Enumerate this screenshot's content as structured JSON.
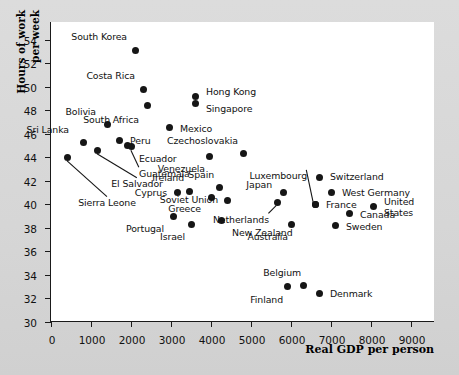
{
  "chart_data": {
    "type": "scatter",
    "title": "",
    "xlabel": "Real GDP per person",
    "ylabel_line1": "Hours of work",
    "ylabel_line2": "per week",
    "xlim": [
      0,
      9600
    ],
    "ylim": [
      30,
      55.5
    ],
    "xticks": [
      0,
      1000,
      2000,
      3000,
      4000,
      5000,
      6000,
      7000,
      8000,
      9000
    ],
    "xticklabels": [
      "0",
      "1000",
      "2000",
      "3000",
      "4000",
      "5000",
      "6000",
      "7000",
      "8000",
      "9000"
    ],
    "yticks": [
      30,
      32,
      34,
      36,
      38,
      40,
      42,
      44,
      46,
      48,
      50,
      52,
      54
    ],
    "yticklabels": [
      "30",
      "32",
      "34",
      "36",
      "38",
      "40",
      "42",
      "44",
      "46",
      "48",
      "50",
      "52",
      "54"
    ],
    "grid": false,
    "legend": null,
    "marker_color": "#161616",
    "points": [
      {
        "name": "Sierra Leone",
        "x": 400,
        "y": 44.0,
        "label_dx": 40,
        "label_dy": 46,
        "anchor": "c",
        "leader": true
      },
      {
        "name": "Sri Lanka",
        "x": 800,
        "y": 45.3,
        "label_dx": -14,
        "label_dy": -12,
        "anchor": "r",
        "leader": false
      },
      {
        "name": "El Salvador",
        "x": 1150,
        "y": 44.6,
        "label_dx": 40,
        "label_dy": 34,
        "anchor": "c",
        "leader": true
      },
      {
        "name": "Bolivia",
        "x": 1400,
        "y": 46.8,
        "label_dx": -11,
        "label_dy": -12,
        "anchor": "r",
        "leader": false
      },
      {
        "name": "Peru",
        "x": 1700,
        "y": 45.4,
        "label_dx": 11,
        "label_dy": 0,
        "anchor": "l",
        "leader": false
      },
      {
        "name": "Ecuador",
        "x": 1900,
        "y": 45.0,
        "label_dx": 12,
        "label_dy": 13,
        "anchor": "l",
        "leader": false
      },
      {
        "name": "Guatemala",
        "x": 2000,
        "y": 44.9,
        "label_dx": 8,
        "label_dy": 27,
        "anchor": "l",
        "leader": true
      },
      {
        "name": "South Korea",
        "x": 2100,
        "y": 53.1,
        "label_dx": -8,
        "label_dy": -13,
        "anchor": "r",
        "leader": false
      },
      {
        "name": "Costa Rica",
        "x": 2300,
        "y": 49.8,
        "label_dx": -8,
        "label_dy": -13,
        "anchor": "r",
        "leader": false
      },
      {
        "name": "South Africa",
        "x": 2400,
        "y": 48.4,
        "label_dx": -8,
        "label_dy": 14,
        "anchor": "r",
        "leader": false
      },
      {
        "name": "Mexico",
        "x": 2950,
        "y": 46.5,
        "label_dx": 11,
        "label_dy": 1,
        "anchor": "l",
        "leader": false
      },
      {
        "name": "Portugal",
        "x": 3050,
        "y": 39.0,
        "label_dx": -9,
        "label_dy": 13,
        "anchor": "r",
        "leader": false
      },
      {
        "name": "Cyprus",
        "x": 3150,
        "y": 41.0,
        "label_dx": -10,
        "label_dy": 0,
        "anchor": "r",
        "leader": false
      },
      {
        "name": "Ireland",
        "x": 3450,
        "y": 41.1,
        "label_dx": -5,
        "label_dy": -13,
        "anchor": "r",
        "leader": false
      },
      {
        "name": "Israel",
        "x": 3500,
        "y": 38.3,
        "label_dx": -6,
        "label_dy": 13,
        "anchor": "r",
        "leader": false
      },
      {
        "name": "Venezuela",
        "x": 3950,
        "y": 44.1,
        "label_dx": -4,
        "label_dy": 13,
        "anchor": "r",
        "leader": false
      },
      {
        "name": "Greece",
        "x": 4000,
        "y": 40.6,
        "label_dx": -10,
        "label_dy": 12,
        "anchor": "r",
        "leader": false
      },
      {
        "name": "Spain",
        "x": 4200,
        "y": 41.4,
        "label_dx": -5,
        "label_dy": -13,
        "anchor": "r",
        "leader": false
      },
      {
        "name": "New Zealand",
        "x": 4250,
        "y": 38.6,
        "label_dx": 11,
        "label_dy": 12,
        "anchor": "l",
        "leader": false
      },
      {
        "name": "Soviet Union",
        "x": 4400,
        "y": 40.3,
        "label_dx": -9,
        "label_dy": -1,
        "anchor": "r",
        "leader": false
      },
      {
        "name": "Czechoslovakia",
        "x": 4800,
        "y": 44.3,
        "label_dx": -5,
        "label_dy": -13,
        "anchor": "r",
        "leader": false
      },
      {
        "name": "Netherlands",
        "x": 5650,
        "y": 40.2,
        "label_dx": -8,
        "label_dy": 18,
        "anchor": "r",
        "leader": true
      },
      {
        "name": "Japan",
        "x": 5800,
        "y": 41.0,
        "label_dx": -11,
        "label_dy": -8,
        "anchor": "r",
        "leader": false
      },
      {
        "name": "Finland",
        "x": 5900,
        "y": 33.0,
        "label_dx": -4,
        "label_dy": 13,
        "anchor": "r",
        "leader": false
      },
      {
        "name": "Australia",
        "x": 6000,
        "y": 38.3,
        "label_dx": -3,
        "label_dy": 13,
        "anchor": "r",
        "leader": false
      },
      {
        "name": "Belgium",
        "x": 6300,
        "y": 33.1,
        "label_dx": -2,
        "label_dy": -13,
        "anchor": "r",
        "leader": false
      },
      {
        "name": "France",
        "x": 6600,
        "y": 40.0,
        "label_dx": 11,
        "label_dy": 1,
        "anchor": "l",
        "leader": false
      },
      {
        "name": "Luxembourg",
        "x": 6600,
        "y": 40.0,
        "label_dx": -8,
        "label_dy": -28,
        "anchor": "r",
        "leader": true
      },
      {
        "name": "Switzerland",
        "x": 6700,
        "y": 42.3,
        "label_dx": 11,
        "label_dy": 0,
        "anchor": "l",
        "leader": false
      },
      {
        "name": "Denmark",
        "x": 6700,
        "y": 32.4,
        "label_dx": 11,
        "label_dy": 0,
        "anchor": "l",
        "leader": false
      },
      {
        "name": "West Germany",
        "x": 7000,
        "y": 41.0,
        "label_dx": 11,
        "label_dy": 0,
        "anchor": "l",
        "leader": false
      },
      {
        "name": "Sweden",
        "x": 7100,
        "y": 38.2,
        "label_dx": 11,
        "label_dy": 1,
        "anchor": "l",
        "leader": false
      },
      {
        "name": "Canada",
        "x": 7450,
        "y": 39.2,
        "label_dx": 11,
        "label_dy": 1,
        "anchor": "l",
        "leader": false
      },
      {
        "name": "Hong Kong",
        "x": 3600,
        "y": 49.2,
        "label_dx": 11,
        "label_dy": -4,
        "anchor": "l",
        "leader": false
      },
      {
        "name": "Singapore",
        "x": 3600,
        "y": 48.6,
        "label_dx": 11,
        "label_dy": 6,
        "anchor": "l",
        "leader": false
      },
      {
        "name": "United States",
        "x": 8050,
        "y": 39.8,
        "label_dx": 11,
        "label_dy": -5,
        "anchor": "l",
        "leader": false
      },
      {
        "name": "United States 2",
        "x": 8050,
        "y": 39.8,
        "label_dx": 11,
        "label_dy": 6,
        "anchor": "l",
        "leader": false,
        "hide_point": true
      }
    ],
    "labels_override": [
      {
        "text": "United",
        "x": 8050,
        "y": 39.8,
        "dx": 11,
        "dy": -5,
        "anchor": "l"
      },
      {
        "text": "States",
        "x": 8050,
        "y": 39.8,
        "dx": 11,
        "dy": 6,
        "anchor": "l"
      }
    ]
  }
}
